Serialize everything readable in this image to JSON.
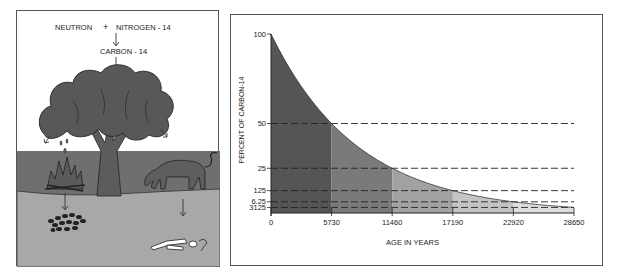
{
  "illustration": {
    "reaction_line1_left": "NEUTRON",
    "reaction_plus": "+",
    "reaction_line1_right": "NITROGEN - 14",
    "reaction_line2": "CARBON - 14",
    "reaction_line3": "CARBON  DIOXIDE",
    "scene_elements": [
      "tree",
      "fire",
      "cow",
      "charcoal",
      "bones"
    ]
  },
  "colors": {
    "tree": "#555555",
    "ground": "#6f6f6f",
    "soil": "#a8a8a8",
    "shade1": "#555555",
    "shade2": "#7a7a7a",
    "shade3": "#a2a2a2",
    "shade4": "#c4c4c4",
    "shade5": "#dedede"
  },
  "chart_data": {
    "type": "area",
    "title": "",
    "xlabel": "AGE IN YEARS",
    "ylabel": "PERCENT OF CARBON-14",
    "xlim": [
      0,
      28650
    ],
    "ylim": [
      0,
      100
    ],
    "x_ticks": [
      "0",
      "5730",
      "11460",
      "17190",
      "22920",
      "28650"
    ],
    "y_ticks": [
      "100",
      "50",
      "25",
      "12.5",
      "6.25",
      "3.125"
    ],
    "y_tick_labels": [
      "100",
      "50",
      "25",
      "125",
      "6.25",
      "3125"
    ],
    "half_life": 5730,
    "x": [
      0,
      5730,
      11460,
      17190,
      22920,
      28650
    ],
    "values": [
      100,
      50,
      25,
      12.5,
      6.25,
      3.125
    ],
    "dashed_reference_levels": [
      50,
      25,
      12.5,
      6.25,
      3.125
    ],
    "grid": false,
    "legend": "none"
  }
}
